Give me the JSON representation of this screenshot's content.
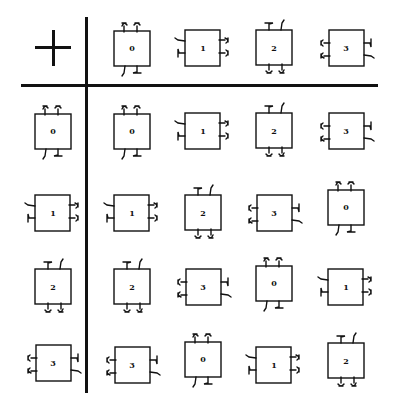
{
  "table": {
    "operator": "+",
    "column_headers": [
      {
        "label": "0",
        "rotation": 0
      },
      {
        "label": "1",
        "rotation": 1
      },
      {
        "label": "2",
        "rotation": 2
      },
      {
        "label": "3",
        "rotation": 3
      }
    ],
    "row_headers": [
      {
        "label": "0",
        "rotation": 0
      },
      {
        "label": "1",
        "rotation": 1
      },
      {
        "label": "2",
        "rotation": 2
      },
      {
        "label": "3",
        "rotation": 3
      }
    ],
    "rows": [
      [
        {
          "label": "0"
        },
        {
          "label": "1"
        },
        {
          "label": "2"
        },
        {
          "label": "3"
        }
      ],
      [
        {
          "label": "1"
        },
        {
          "label": "2"
        },
        {
          "label": "3"
        },
        {
          "label": "0"
        }
      ],
      [
        {
          "label": "2"
        },
        {
          "label": "3"
        },
        {
          "label": "0"
        },
        {
          "label": "1"
        }
      ],
      [
        {
          "label": "3"
        },
        {
          "label": "0"
        },
        {
          "label": "1"
        },
        {
          "label": "2"
        }
      ]
    ]
  }
}
